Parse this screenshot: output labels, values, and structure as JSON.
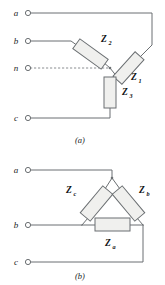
{
  "figure": {
    "title_a": "(a)",
    "title_b": "(b)",
    "stroke_color": "#6b6f72",
    "box_fill": "#f0f0ee",
    "text_color": "#222426"
  },
  "diagram_a": {
    "caption": "(a)",
    "terminals": [
      {
        "label": "a",
        "x": 17,
        "y": 16,
        "cx": 28,
        "cy": 13
      },
      {
        "label": "b",
        "x": 17,
        "y": 44,
        "cx": 28,
        "cy": 41
      },
      {
        "label": "n",
        "x": 17,
        "y": 71,
        "cx": 28,
        "cy": 68
      },
      {
        "label": "c",
        "x": 17,
        "y": 121,
        "cx": 28,
        "cy": 118
      }
    ],
    "impedances": [
      {
        "name": "Z",
        "sub": "1",
        "lx": 131,
        "ly": 78
      },
      {
        "name": "Z",
        "sub": "2",
        "lx": 101,
        "ly": 42
      },
      {
        "name": "Z",
        "sub": "3",
        "lx": 122,
        "ly": 93
      }
    ],
    "neutral_style": "dashed"
  },
  "diagram_b": {
    "caption": "(b)",
    "terminals": [
      {
        "label": "a",
        "x": 17,
        "y": 173,
        "cx": 28,
        "cy": 170
      },
      {
        "label": "b",
        "x": 17,
        "y": 228,
        "cx": 28,
        "cy": 225
      },
      {
        "label": "c",
        "x": 17,
        "y": 265,
        "cx": 28,
        "cy": 262
      }
    ],
    "impedances": [
      {
        "name": "Z",
        "sub": "a",
        "lx": 105,
        "ly": 246
      },
      {
        "name": "Z",
        "sub": "b",
        "lx": 139,
        "ly": 193
      },
      {
        "name": "Z",
        "sub": "c",
        "lx": 66,
        "ly": 193
      }
    ]
  }
}
